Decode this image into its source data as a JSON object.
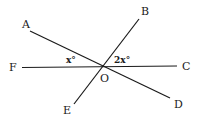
{
  "diagram": {
    "type": "geometry-intersecting-lines",
    "center": {
      "label": "O",
      "x": 101,
      "y": 67
    },
    "points": [
      {
        "label": "A",
        "x": 30,
        "y": 31,
        "label_x": 22,
        "label_y": 28
      },
      {
        "label": "B",
        "x": 139,
        "y": 19,
        "label_x": 141,
        "label_y": 15
      },
      {
        "label": "C",
        "x": 177,
        "y": 66,
        "label_x": 182,
        "label_y": 70
      },
      {
        "label": "D",
        "x": 170,
        "y": 98,
        "label_x": 174,
        "label_y": 108
      },
      {
        "label": "E",
        "x": 74,
        "y": 104,
        "label_x": 63,
        "label_y": 114
      },
      {
        "label": "F",
        "x": 22,
        "y": 68,
        "label_x": 9,
        "label_y": 71
      }
    ],
    "lines": [
      {
        "name": "line-AD",
        "from": "A",
        "to": "D"
      },
      {
        "name": "line-BE",
        "from": "B",
        "to": "E"
      },
      {
        "name": "line-FC",
        "from": "F",
        "to": "C"
      }
    ],
    "angles": [
      {
        "label": "x°",
        "between": [
          "F",
          "A"
        ],
        "x": 66,
        "y": 62
      },
      {
        "label": "2x°",
        "between": [
          "B",
          "C"
        ],
        "x": 114,
        "y": 62
      }
    ]
  },
  "labels": {
    "A": "A",
    "B": "B",
    "C": "C",
    "D": "D",
    "E": "E",
    "F": "F",
    "O": "O",
    "angle_x": "x°",
    "angle_2x": "2x°"
  }
}
